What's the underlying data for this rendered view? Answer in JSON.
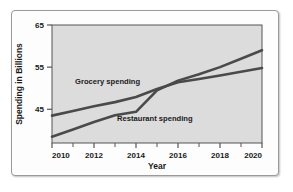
{
  "chart_data": {
    "type": "line",
    "title": "",
    "xlabel": "Year",
    "ylabel": "Spending in Billions",
    "xlim": [
      2010,
      2020
    ],
    "ylim": [
      37,
      65
    ],
    "grid": false,
    "legend_position": "inline-annotations",
    "x_ticks": [
      2010,
      2012,
      2014,
      2016,
      2018,
      2020
    ],
    "x_tick_labels": [
      "2010",
      "2012",
      "2014",
      "2016",
      "2018",
      "2020"
    ],
    "x_minor_ticks": [
      2011,
      2013,
      2015,
      2017,
      2019
    ],
    "y_ticks": [
      45,
      55,
      65
    ],
    "y_tick_labels": [
      "45",
      "55",
      "65"
    ],
    "x": [
      2010,
      2011,
      2012,
      2013,
      2014,
      2015,
      2016,
      2017,
      2018,
      2019,
      2020
    ],
    "series": [
      {
        "name": "Grocery spending",
        "label": "Grocery spending",
        "color": "#4a4a4a",
        "values": [
          43.5,
          44.6,
          45.7,
          46.7,
          47.9,
          49.8,
          51.4,
          52.2,
          53.0,
          53.9,
          54.8
        ]
      },
      {
        "name": "Restaurant spending",
        "label": "Restaurant spending",
        "color": "#4a4a4a",
        "values": [
          38.5,
          40.2,
          42.0,
          43.6,
          44.4,
          49.5,
          51.8,
          53.3,
          55.0,
          57.0,
          59.0
        ]
      }
    ],
    "annotations": [
      {
        "text": "Grocery spending",
        "x": 2011.1,
        "y": 50.9
      },
      {
        "text": "Restaurant spending",
        "x": 2013.1,
        "y": 42.3
      }
    ],
    "plot_background": "#dcdcdc",
    "axis_color": "#555555",
    "line_color": "#4a4a4a"
  }
}
